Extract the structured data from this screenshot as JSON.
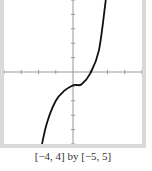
{
  "chart_data": {
    "type": "line",
    "title": "",
    "xlabel": "",
    "ylabel": "",
    "xlim": [
      -4,
      4
    ],
    "ylim": [
      -5,
      5
    ],
    "xticks": [
      -4,
      -3,
      -2,
      -1,
      0,
      1,
      2,
      3,
      4
    ],
    "yticks": [
      -5,
      -4,
      -3,
      -2,
      -1,
      0,
      1,
      2,
      3,
      4,
      5
    ],
    "grid": false,
    "series": [
      {
        "name": "f(x)",
        "description": "cubic curve, flattening near x≈0.2, y≈-0.9; crosses x-axis near x≈1",
        "x": [
          -1.8,
          -1.5,
          -1.0,
          -0.5,
          0.0,
          0.2,
          0.5,
          1.0,
          1.5,
          1.9
        ],
        "y": [
          -5.0,
          -3.5,
          -2.0,
          -1.3,
          -0.92,
          -0.9,
          -0.85,
          -0.1,
          1.5,
          5.0
        ]
      }
    ],
    "colors": {
      "curve": "#111111",
      "axes": "#999999",
      "frame": "#d9d9d9"
    }
  },
  "caption": "[−4, 4] by [−5, 5]"
}
